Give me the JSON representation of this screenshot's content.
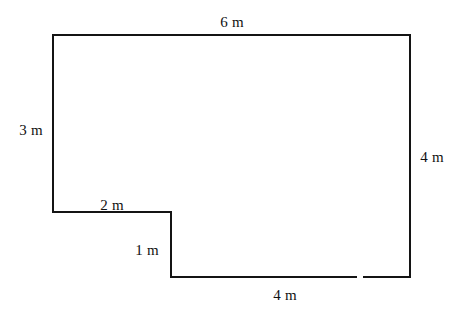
{
  "figure": {
    "kind": "composite-rectilinear-polygon",
    "units": "m",
    "stroke_color": "#141414",
    "fill_color": "#ffffff",
    "background_color": "#ffffff",
    "stroke_width_px": 2
  },
  "labels": {
    "top": "6 m",
    "left": "3 m",
    "right": "4 m",
    "bottom": "4 m",
    "step_horizontal": "2 m",
    "step_vertical": "1 m"
  },
  "chart_data": {
    "type": "table",
    "title": "",
    "xlabel": "",
    "ylabel": "",
    "shape": "L-shaped (rectilinear) hexagon",
    "units": "m",
    "side_labels": [
      "6 m",
      "4 m",
      "4 m",
      "1 m",
      "2 m",
      "3 m"
    ],
    "side_lengths_m": [
      6,
      4,
      4,
      1,
      2,
      3
    ],
    "vertices_px": [
      [
        53,
        35
      ],
      [
        410,
        35
      ],
      [
        410,
        277
      ],
      [
        171,
        277
      ],
      [
        171,
        212
      ],
      [
        53,
        212
      ]
    ],
    "edges": [
      {
        "name": "top",
        "from": [
          53,
          35
        ],
        "to": [
          410,
          35
        ],
        "label": "6 m",
        "length_m": 6,
        "orientation": "horizontal"
      },
      {
        "name": "right",
        "from": [
          410,
          35
        ],
        "to": [
          410,
          277
        ],
        "label": "4 m",
        "length_m": 4,
        "orientation": "vertical"
      },
      {
        "name": "bottom",
        "from": [
          410,
          277
        ],
        "to": [
          171,
          277
        ],
        "label": "4 m",
        "length_m": 4,
        "orientation": "horizontal"
      },
      {
        "name": "step-vertical",
        "from": [
          171,
          277
        ],
        "to": [
          171,
          212
        ],
        "label": "1 m",
        "length_m": 1,
        "orientation": "vertical"
      },
      {
        "name": "step-horizontal",
        "from": [
          171,
          212
        ],
        "to": [
          53,
          212
        ],
        "label": "2 m",
        "length_m": 2,
        "orientation": "horizontal"
      },
      {
        "name": "left",
        "from": [
          53,
          212
        ],
        "to": [
          53,
          35
        ],
        "label": "3 m",
        "length_m": 3,
        "orientation": "vertical"
      }
    ],
    "label_positions_px": {
      "top": [
        232,
        22
      ],
      "left": [
        31,
        130
      ],
      "right": [
        432,
        157
      ],
      "bottom": [
        285,
        295
      ],
      "step_horizontal": [
        112,
        205
      ],
      "step_vertical": [
        147,
        250
      ]
    }
  }
}
